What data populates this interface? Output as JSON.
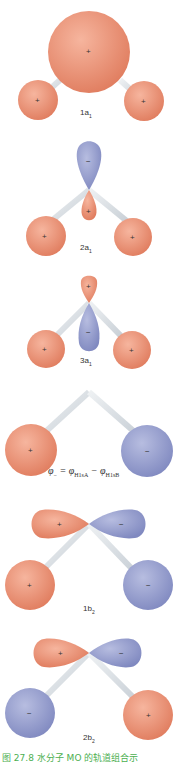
{
  "colors": {
    "positive": "#e8876a",
    "negative": "#8f98c8",
    "bond": "#d8dde2",
    "caption": "#4caf50"
  },
  "orbitals": [
    {
      "label": "1a",
      "sub": "1",
      "center_sign": "+",
      "h_left_sign": "+",
      "h_right_sign": "+"
    },
    {
      "label": "2a",
      "sub": "1",
      "top_lobe_sign": "−",
      "bottom_lobe_sign": "+",
      "h_left_sign": "+",
      "h_right_sign": "+"
    },
    {
      "label": "3a",
      "sub": "1",
      "top_lobe_sign": "+",
      "bottom_lobe_sign": "−",
      "h_left_sign": "+",
      "h_right_sign": "+"
    },
    {
      "label": "",
      "h_left_sign": "+",
      "h_right_sign": "−"
    },
    {
      "label": "1b",
      "sub": "2",
      "left_lobe_sign": "+",
      "right_lobe_sign": "−",
      "h_left_sign": "+",
      "h_right_sign": "−"
    },
    {
      "label": "2b",
      "sub": "2",
      "left_lobe_sign": "+",
      "right_lobe_sign": "−",
      "h_left_sign": "−",
      "h_right_sign": "+"
    }
  ],
  "formula": {
    "lhs": "φ",
    "lhs_sub": "−",
    "eq": " = ",
    "t1": "φ",
    "t1_sub": "H1sA",
    "minus": " − ",
    "t2": "φ",
    "t2_sub": "H1sB"
  },
  "caption": "图 27.8  水分子 MO 的轨道组合示"
}
